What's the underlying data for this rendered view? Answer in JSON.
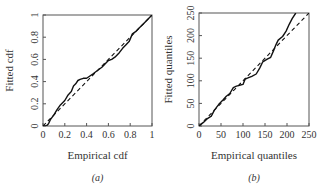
{
  "chart_data": [
    {
      "type": "line",
      "panel_label": "(a)",
      "title": "",
      "xlabel": "Empirical cdf",
      "ylabel": "Fitted cdf",
      "xlim": [
        0,
        1
      ],
      "ylim": [
        0,
        1
      ],
      "xticks": [
        "0",
        "0.2",
        "0.4",
        "0.6",
        "0.8",
        "1"
      ],
      "yticks": [
        "0",
        "0.2",
        "0.4",
        "0.6",
        "0.8",
        "1"
      ],
      "grid": false,
      "legend": null,
      "series": [
        {
          "name": "fitted vs empirical",
          "style": "solid",
          "x": [
            0,
            0.03,
            0.05,
            0.07,
            0.1,
            0.13,
            0.16,
            0.2,
            0.23,
            0.26,
            0.28,
            0.3,
            0.32,
            0.34,
            0.37,
            0.4,
            0.43,
            0.46,
            0.5,
            0.54,
            0.58,
            0.6,
            0.63,
            0.66,
            0.7,
            0.73,
            0.76,
            0.79,
            0.82,
            0.85,
            0.88,
            0.92,
            0.96,
            1.0
          ],
          "y": [
            0,
            0.0,
            0.02,
            0.06,
            0.1,
            0.15,
            0.19,
            0.23,
            0.28,
            0.31,
            0.36,
            0.38,
            0.41,
            0.42,
            0.43,
            0.43,
            0.45,
            0.47,
            0.5,
            0.53,
            0.57,
            0.59,
            0.6,
            0.62,
            0.66,
            0.7,
            0.73,
            0.76,
            0.83,
            0.85,
            0.88,
            0.92,
            0.96,
            1.0
          ]
        },
        {
          "name": "reference line",
          "style": "dashed",
          "x": [
            0,
            1
          ],
          "y": [
            0,
            1
          ]
        }
      ]
    },
    {
      "type": "line",
      "panel_label": "(b)",
      "title": "",
      "xlabel": "Empirical quantiles",
      "ylabel": "Fitted quantiles",
      "xlim": [
        0,
        250
      ],
      "ylim": [
        0,
        250
      ],
      "xticks": [
        "0",
        "50",
        "100",
        "150",
        "200",
        "250"
      ],
      "yticks": [
        "0",
        "50",
        "100",
        "150",
        "200",
        "250"
      ],
      "grid": false,
      "legend": null,
      "series": [
        {
          "name": "fitted vs empirical",
          "style": "solid",
          "x": [
            0,
            10,
            20,
            28,
            35,
            45,
            55,
            62,
            70,
            78,
            85,
            92,
            100,
            105,
            110,
            120,
            130,
            138,
            145,
            155,
            163,
            170,
            175,
            180,
            190,
            198,
            205,
            212,
            220
          ],
          "y": [
            0,
            8,
            17,
            22,
            35,
            48,
            58,
            66,
            72,
            85,
            88,
            90,
            92,
            104,
            106,
            110,
            115,
            128,
            142,
            148,
            152,
            168,
            180,
            190,
            198,
            210,
            225,
            238,
            250
          ],
          "extends_beyond": true
        },
        {
          "name": "reference line",
          "style": "dashed",
          "x": [
            0,
            250
          ],
          "y": [
            0,
            250
          ]
        }
      ]
    }
  ]
}
